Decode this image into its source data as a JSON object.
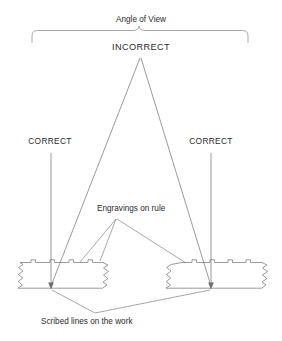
{
  "diagram": {
    "title": "Angle of View",
    "labels": {
      "incorrect": "INCORRECT",
      "correct_left": "CORRECT",
      "correct_right": "CORRECT",
      "engravings": "Engravings on rule",
      "scribed": "Scribed lines on the work"
    },
    "colors": {
      "background": "#ffffff",
      "line": "#6d6d6d",
      "text": "#2b2b2b",
      "brace": "#8a8a8a"
    },
    "geometry": {
      "brace": {
        "left_x": 32,
        "right_x": 248,
        "top_y": 30,
        "bar_y": 42,
        "peak_x": 140,
        "peak_y": 33
      },
      "apex": {
        "x": 140,
        "y": 58
      },
      "incorrect_sight_targets": [
        {
          "x": 51,
          "y": 288
        },
        {
          "x": 211,
          "y": 288
        }
      ],
      "correct_left_line": {
        "x": 51,
        "y_top": 152,
        "y_bottom": 288
      },
      "correct_right_line": {
        "x": 211,
        "y_top": 152,
        "y_bottom": 288
      },
      "rule_left": {
        "x": 18,
        "y": 262,
        "width": 96,
        "height": 26,
        "skew": 12
      },
      "rule_right": {
        "x": 164,
        "y": 262,
        "width": 104,
        "height": 26,
        "skew": 12
      },
      "engraving_leader_origin": {
        "x": 116,
        "y": 219
      },
      "scribed_leader_origin": {
        "x": 95,
        "y": 313
      }
    }
  }
}
